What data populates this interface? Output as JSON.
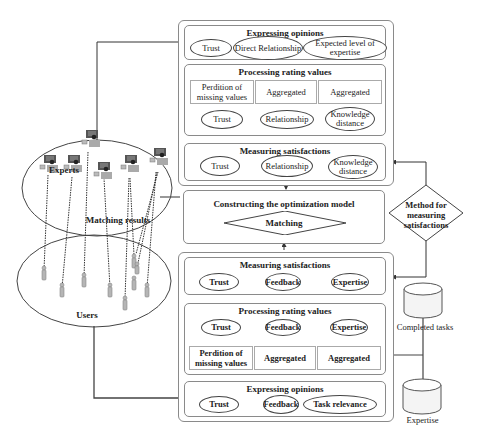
{
  "top_panel": {
    "expressing": {
      "title": "Expressing opinions",
      "items": [
        "Trust",
        "Direct Relationship",
        "Expected level of expertise"
      ]
    },
    "processing": {
      "title": "Processing rating values",
      "steps": [
        "Perdition of missing values",
        "Aggregated",
        "Aggregated"
      ],
      "outputs": [
        "Trust",
        "Relationship",
        "Knowledge distance"
      ]
    },
    "measuring": {
      "title": "Measuring satisfactions",
      "items": [
        "Trust",
        "Relationship",
        "Knowledge distance"
      ]
    }
  },
  "optimization": {
    "title": "Constructing the optimization model",
    "decision": "Matching"
  },
  "method": {
    "label": "Method for measuring satisfactions"
  },
  "bottom_panel": {
    "measuring": {
      "title": "Measuring satisfactions",
      "items": [
        "Trust",
        "Feedback",
        "Expertise"
      ]
    },
    "processing": {
      "title": "Processing rating values",
      "outputs": [
        "Trust",
        "Feedback",
        "Expertise"
      ],
      "steps": [
        "Perdition of missing values",
        "Aggregated",
        "Aggregated"
      ]
    },
    "expressing": {
      "title": "Expressing opinions",
      "items": [
        "Trust",
        "Feedback",
        "Task relevance"
      ]
    }
  },
  "left": {
    "experts_label": "Experts",
    "users_label": "Users",
    "matching_label": "Matching results",
    "expert_count": 6,
    "user_count": 9
  },
  "databases": {
    "completed_tasks": "Completed tasks",
    "expertise": "Expertise"
  },
  "colors": {
    "line": "#333333",
    "border": "#8a8a8a",
    "icon_body": "#a8a8a8",
    "icon_screen": "#555555"
  }
}
